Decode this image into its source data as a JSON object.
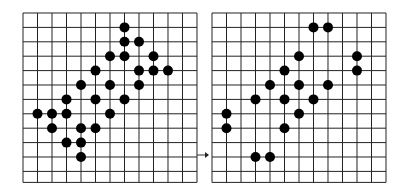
{
  "figure": {
    "grid": {
      "columns": 12,
      "rows": 12,
      "line_color": "#222222",
      "dot_color": "#000000",
      "background": "#ffffff"
    },
    "panels": [
      {
        "name": "before",
        "dots": [
          [
            7,
            1
          ],
          [
            7,
            2
          ],
          [
            8,
            2
          ],
          [
            6,
            3
          ],
          [
            7,
            3
          ],
          [
            9,
            3
          ],
          [
            5,
            4
          ],
          [
            8,
            4
          ],
          [
            9,
            4
          ],
          [
            10,
            4
          ],
          [
            4,
            5
          ],
          [
            6,
            5
          ],
          [
            8,
            5
          ],
          [
            3,
            6
          ],
          [
            5,
            6
          ],
          [
            7,
            6
          ],
          [
            1,
            7
          ],
          [
            2,
            7
          ],
          [
            3,
            7
          ],
          [
            6,
            7
          ],
          [
            2,
            8
          ],
          [
            4,
            8
          ],
          [
            5,
            8
          ],
          [
            3,
            9
          ],
          [
            4,
            9
          ],
          [
            4,
            10
          ]
        ]
      },
      {
        "name": "after",
        "dots": [
          [
            7,
            1
          ],
          [
            8,
            1
          ],
          [
            6,
            3
          ],
          [
            10,
            3
          ],
          [
            5,
            4
          ],
          [
            10,
            4
          ],
          [
            4,
            5
          ],
          [
            6,
            5
          ],
          [
            8,
            5
          ],
          [
            3,
            6
          ],
          [
            5,
            6
          ],
          [
            7,
            6
          ],
          [
            1,
            7
          ],
          [
            6,
            7
          ],
          [
            1,
            8
          ],
          [
            5,
            8
          ],
          [
            3,
            10
          ],
          [
            4,
            10
          ]
        ]
      }
    ],
    "arrow": {
      "direction": "right",
      "symbol": "→"
    }
  }
}
